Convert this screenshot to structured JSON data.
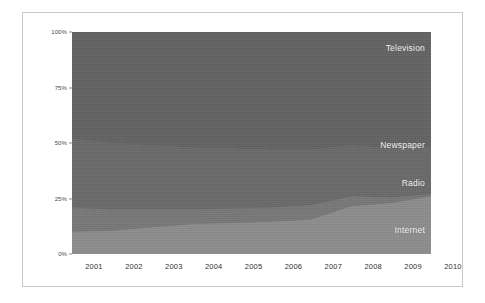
{
  "chart_data": {
    "type": "area",
    "stacked": true,
    "normalized": "100%",
    "title": "",
    "subtitle": "",
    "xlabel": "",
    "ylabel": "",
    "grid": false,
    "legend_position": "in-plot-right",
    "x": [
      2001,
      2002,
      2003,
      2004,
      2005,
      2006,
      2007,
      2008,
      2009,
      2010
    ],
    "categories": [
      "2001",
      "2002",
      "2003",
      "2004",
      "2005",
      "2006",
      "2007",
      "2008",
      "2009",
      "2010"
    ],
    "xtick_labels": [
      "2001",
      "2002",
      "2003",
      "2004",
      "2005",
      "2006",
      "2007",
      "2008",
      "2009",
      "2010"
    ],
    "ytick_labels": [
      "0%",
      "25%",
      "50%",
      "75%",
      "100%"
    ],
    "ytick_values": [
      0,
      25,
      50,
      75,
      100
    ],
    "ylim": [
      0,
      100
    ],
    "xlim": [
      2001,
      2010
    ],
    "series": [
      {
        "name": "Internet",
        "label": "Internet",
        "color": "#8d8d8d",
        "label_color": "#ffffff",
        "values": [
          10,
          10.5,
          12,
          13.5,
          14,
          14.5,
          15.5,
          21.5,
          23,
          26
        ]
      },
      {
        "name": "Radio",
        "label": "Radio",
        "color": "#787878",
        "label_color": "#ffffff",
        "values": [
          11,
          9.5,
          8,
          6.5,
          6.5,
          6.5,
          6.5,
          4.5,
          2.5,
          1
        ]
      },
      {
        "name": "Newspaper",
        "label": "Newspaper",
        "color": "#6a6a6a",
        "label_color": "#ffffff",
        "values": [
          31,
          30,
          29,
          28,
          27,
          26,
          25,
          23,
          22,
          21
        ]
      },
      {
        "name": "Television",
        "label": "Television",
        "color": "#636363",
        "label_color": "#ffffff",
        "values": [
          48,
          50,
          51,
          52,
          52.5,
          53,
          53,
          51,
          52.5,
          52
        ]
      }
    ],
    "series_label_positions": [
      {
        "name": "Television",
        "x_pct": 100,
        "y_pct": 93
      },
      {
        "name": "Newspaper",
        "x_pct": 100,
        "y_pct": 49
      },
      {
        "name": "Radio",
        "x_pct": 100,
        "y_pct": 32
      },
      {
        "name": "Internet",
        "x_pct": 100,
        "y_pct": 11
      }
    ],
    "colors": {
      "internet": "#8d8d8d",
      "radio": "#787878",
      "newspaper": "#6a6a6a",
      "television": "#636363",
      "frame": "#c9c9c9",
      "axis_text": "#2f2f2f",
      "page_background": "#ffffff"
    }
  }
}
